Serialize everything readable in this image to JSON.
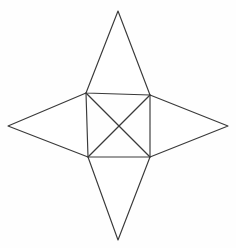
{
  "figure": {
    "canvas": {
      "width": 236,
      "height": 248,
      "background_color": "#fefefe"
    },
    "style": {
      "stroke_color": "#3a3a3a",
      "stroke_width": 1.15,
      "fill_color": "#ffffff"
    },
    "points": {
      "top_tip": {
        "x": 118,
        "y": 11
      },
      "left_tip": {
        "x": 8,
        "y": 126
      },
      "right_tip": {
        "x": 228,
        "y": 126
      },
      "bottom_tip": {
        "x": 118,
        "y": 240
      },
      "inner_top_left": {
        "x": 86,
        "y": 93
      },
      "inner_top_right": {
        "x": 150,
        "y": 95
      },
      "inner_bottom_left": {
        "x": 88,
        "y": 157
      },
      "inner_bottom_right": {
        "x": 150,
        "y": 157
      },
      "center_crossing": {
        "x": 119,
        "y": 126
      }
    },
    "shapes": [
      {
        "name": "top-spike",
        "label": "Top point",
        "path": "M 118 11 L 150 95 L 86 93 Z"
      },
      {
        "name": "left-spike",
        "label": "Left point",
        "path": "M 8 126 L 86 93 L 88 157 Z"
      },
      {
        "name": "right-spike",
        "label": "Right point",
        "path": "M 228 126 L 150 95 L 150 157 Z"
      },
      {
        "name": "bottom-spike",
        "label": "Bottom point",
        "path": "M 118 240 L 88 157 L 150 157 Z"
      }
    ],
    "diagonals": [
      {
        "name": "diagonal-nw-se",
        "label": "Northwest to southeast diagonal",
        "x1": 86,
        "y1": 93,
        "x2": 150,
        "y2": 157
      },
      {
        "name": "diagonal-ne-sw",
        "label": "Northeast to southwest diagonal",
        "x1": 150,
        "y1": 95,
        "x2": 88,
        "y2": 157
      }
    ]
  }
}
